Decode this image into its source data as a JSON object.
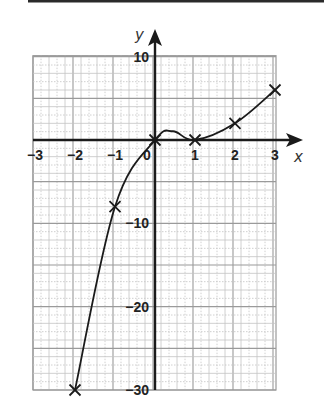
{
  "chart_data": {
    "type": "line",
    "title": "",
    "xlabel": "x",
    "ylabel": "y",
    "xlim": [
      -3,
      3
    ],
    "ylim": [
      -30,
      10
    ],
    "grid": true,
    "x_ticks": [
      -3,
      -2,
      -1,
      0,
      1,
      2,
      3
    ],
    "y_ticks": [
      10,
      -10,
      -20,
      -30
    ],
    "x_tick_labels": [
      "−3",
      "−2",
      "−1",
      "0",
      "1",
      "2",
      "3"
    ],
    "y_tick_labels": [
      "10",
      "−10",
      "−20",
      "−30"
    ],
    "series": [
      {
        "name": "curve",
        "marker": "x",
        "points": [
          {
            "x": -2,
            "y": -30
          },
          {
            "x": -1,
            "y": -8
          },
          {
            "x": 0,
            "y": 0
          },
          {
            "x": 1,
            "y": 0
          },
          {
            "x": 2,
            "y": 2
          },
          {
            "x": 3,
            "y": 6
          }
        ]
      }
    ],
    "annotations": [
      "local maximum near x ≈ 0.45, y ≈ 1"
    ]
  },
  "colors": {
    "grid_major": "#9a9a9a",
    "grid_minor": "#c4c4c4",
    "axis": "#1a1a1a",
    "curve": "#1a1a1a",
    "top_rule": "#2a2a2a"
  }
}
